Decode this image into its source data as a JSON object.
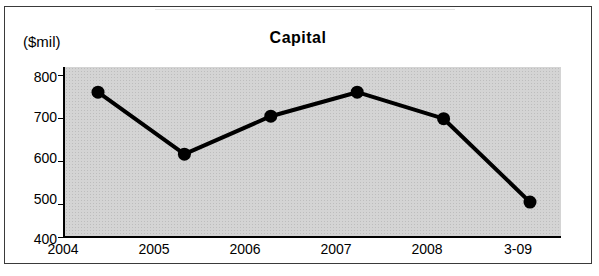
{
  "chart_data": {
    "type": "line",
    "title": "Capital",
    "unit_label": "($mil)",
    "xlabel": "",
    "ylabel": "",
    "categories": [
      "2004",
      "2005",
      "2006",
      "2007",
      "2008",
      "3-09"
    ],
    "values": [
      741,
      596,
      685,
      741,
      679,
      484
    ],
    "ylim": [
      400,
      800
    ],
    "yticks": [
      400,
      500,
      600,
      700,
      800
    ],
    "grid": false,
    "legend": null,
    "series": [
      {
        "name": "Capital",
        "values": [
          741,
          596,
          685,
          741,
          679,
          484
        ]
      }
    ],
    "colors": {
      "line": "#000000",
      "marker": "#000000",
      "plot_background": "#d4d4d4",
      "frame": "#3a3a3a"
    }
  }
}
